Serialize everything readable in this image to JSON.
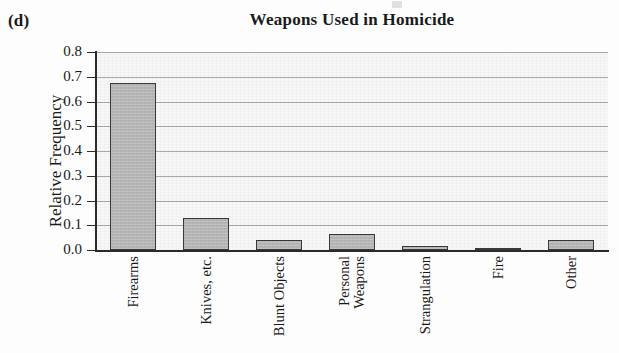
{
  "figure": {
    "panel_letter": "(d)",
    "title": "Weapons Used in Homicide"
  },
  "axes": {
    "ylabel": "Relative Frequency",
    "xlabel": "",
    "ytick_labels": [
      "0.8",
      "0.7",
      "0.6",
      "0.5",
      "0.4",
      "0.3",
      "0.2",
      "0.1",
      "0.0"
    ]
  },
  "colors": {
    "bar_fill": "#b6b6b6",
    "bar_edge": "#3a3a3a",
    "gridline": "#a8a8a8",
    "axis": "#2b2b2b",
    "plot_background": "#f7f7f7",
    "text": "#1a1a1a"
  },
  "chart_data": {
    "type": "bar",
    "title": "Weapons Used in Homicide",
    "xlabel": "",
    "ylabel": "Relative Frequency",
    "ylim": [
      0.0,
      0.8
    ],
    "ytick_values": [
      0.0,
      0.1,
      0.2,
      0.3,
      0.4,
      0.5,
      0.6,
      0.7,
      0.8
    ],
    "grid": true,
    "grid_axis": "y",
    "legend": false,
    "categories": [
      "Firearms",
      "Knives, etc.",
      "Blunt Objects",
      "Personal Weapons",
      "Strangulation",
      "Fire",
      "Other"
    ],
    "category_display": [
      "Firearms",
      "Knives, etc.",
      "Blunt Objects",
      "Personal\nWeapons",
      "Strangulation",
      "Fire",
      "Other"
    ],
    "values": [
      0.675,
      0.13,
      0.04,
      0.065,
      0.015,
      0.01,
      0.04
    ]
  }
}
